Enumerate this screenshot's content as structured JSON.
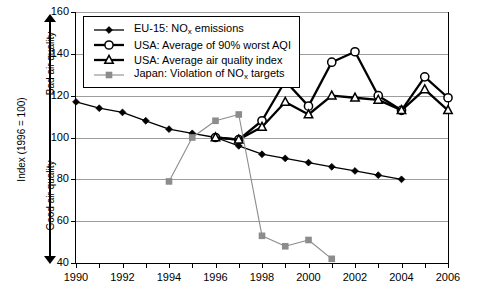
{
  "chart_data": {
    "type": "line",
    "title": "",
    "xlabel": "",
    "ylabel": "Index (1996 = 100)",
    "xlim": [
      1989,
      2007
    ],
    "ylim": [
      40,
      160
    ],
    "yticks": [
      40,
      60,
      80,
      100,
      120,
      140,
      160
    ],
    "xticks": [
      1990,
      1991,
      1992,
      1993,
      1994,
      1995,
      1996,
      1997,
      1998,
      1999,
      2000,
      2001,
      2002,
      2003,
      2004,
      2005,
      2006
    ],
    "xtick_labels_shown": [
      1990,
      1992,
      1994,
      1996,
      1998,
      2000,
      2002,
      2004,
      2006
    ],
    "grid": "horizontal",
    "legend_position": "top-left",
    "axis_annotations": {
      "top": "Bad air quality",
      "bottom": "Good air quality"
    },
    "series": [
      {
        "name": "EU-15: NOx emissions",
        "label_parts": [
          "EU-15: NO",
          "x",
          " emissions"
        ],
        "marker": "filled-diamond",
        "color": "#000000",
        "x": [
          1990,
          1991,
          1992,
          1993,
          1994,
          1995,
          1996,
          1997,
          1998,
          1999,
          2000,
          2001,
          2002,
          2003,
          2004
        ],
        "values": [
          117,
          114,
          112,
          108,
          104,
          102,
          100,
          96,
          92,
          90,
          88,
          86,
          84,
          82,
          80
        ]
      },
      {
        "name": "USA: Average of 90% worst AQI",
        "label_parts": [
          "USA: Average of 90% worst AQI"
        ],
        "marker": "open-circle",
        "color": "#000000",
        "x": [
          1996,
          1997,
          1998,
          1999,
          2000,
          2001,
          2002,
          2003,
          2004,
          2005,
          2006
        ],
        "values": [
          100,
          99,
          108,
          127,
          115,
          136,
          141,
          120,
          113,
          129,
          119
        ]
      },
      {
        "name": "USA: Average air quality index",
        "label_parts": [
          "USA: Average air quality index"
        ],
        "marker": "open-triangle",
        "color": "#000000",
        "x": [
          1996,
          1997,
          1998,
          1999,
          2000,
          2001,
          2002,
          2003,
          2004,
          2005,
          2006
        ],
        "values": [
          100,
          99,
          105,
          117,
          111,
          120,
          119,
          118,
          113,
          123,
          113
        ]
      },
      {
        "name": "Japan: Violation of NOx targets",
        "label_parts": [
          "Japan: Violation of NO",
          "x",
          " targets"
        ],
        "marker": "filled-square",
        "color": "#8c8c8c",
        "x": [
          1994,
          1995,
          1996,
          1997,
          1998,
          1999,
          2000,
          2001
        ],
        "values": [
          79,
          100,
          108,
          111,
          53,
          48,
          51,
          42
        ]
      }
    ]
  },
  "yaxis": {
    "label": "Index (1996 = 100)",
    "top_annotation": "Bad air quality",
    "bottom_annotation": "Good air quality",
    "tick_labels": [
      "160",
      "140",
      "120",
      "100",
      "80",
      "60",
      "40"
    ]
  },
  "xaxis": {
    "tick_labels": [
      "1990",
      "1992",
      "1994",
      "1996",
      "1998",
      "2000",
      "2002",
      "2004",
      "2006"
    ]
  },
  "legend": {
    "items": [
      {
        "symbol": "filled-diamond",
        "pre": "EU-15: NO",
        "sub": "x",
        "post": " emissions",
        "color": "#000000"
      },
      {
        "symbol": "open-circle",
        "pre": "USA: Average of 90% worst AQI",
        "sub": "",
        "post": "",
        "color": "#000000"
      },
      {
        "symbol": "open-triangle",
        "pre": "USA: Average air quality index",
        "sub": "",
        "post": "",
        "color": "#000000"
      },
      {
        "symbol": "filled-square",
        "pre": "Japan: Violation of NO",
        "sub": "x",
        "post": " targets",
        "color": "#8c8c8c"
      }
    ]
  }
}
